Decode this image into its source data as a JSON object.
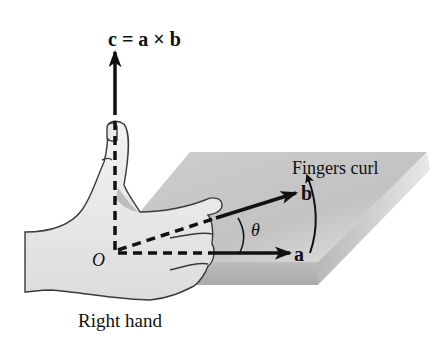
{
  "figure": {
    "labels": {
      "c_vector": "c = a × b",
      "b_vector": "b",
      "a_vector": "a",
      "theta": "θ",
      "origin": "O",
      "fingers_curl": "Fingers curl",
      "right_hand": "Right hand"
    },
    "colors": {
      "ink": "#111111",
      "plane_top": "#c9c9c9",
      "plane_side": "#b4b4b4",
      "hand_fill": "#ececec",
      "hand_outline": "#3a3a3a"
    }
  }
}
